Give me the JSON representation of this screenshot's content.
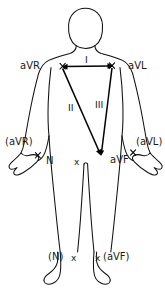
{
  "diagram": {
    "background_color": "#ffffff",
    "line_color": "#000000",
    "text_color": "#1a1a1a",
    "labels": {
      "lead_one": "I",
      "lead_two": "II",
      "lead_three": "III",
      "avr_shoulder": "aVR",
      "avl_shoulder": "aVL",
      "avr_hand": "(aVR)",
      "avl_hand": "(aVL)",
      "avf_vertex": "aVF",
      "neutral_hand": "N",
      "neutral_foot": "(N)",
      "avf_foot": "(aVF)",
      "electrode_mark": "x"
    }
  }
}
